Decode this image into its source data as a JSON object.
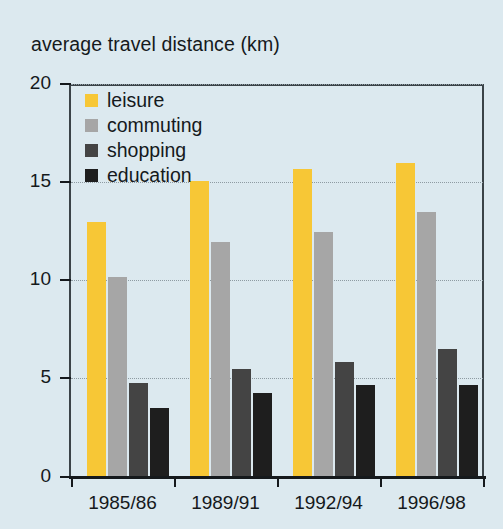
{
  "chart_data": {
    "type": "bar",
    "title": "average travel distance (km)",
    "xlabel": "",
    "ylabel": "average travel distance (km)",
    "ylim": [
      0,
      20
    ],
    "yticks": [
      0,
      5,
      10,
      15,
      20
    ],
    "ytick_labels": [
      "0",
      "5",
      "10",
      "15",
      "20"
    ],
    "grid": true,
    "legend_position": "top-left inside plot",
    "categories": [
      "1985/86",
      "1989/91",
      "1992/94",
      "1996/98"
    ],
    "series": [
      {
        "name": "leisure",
        "color": "#f7c736",
        "values": [
          13.0,
          15.1,
          15.7,
          16.0
        ]
      },
      {
        "name": "commuting",
        "color": "#a6a6a6",
        "values": [
          10.2,
          12.0,
          12.5,
          13.5
        ]
      },
      {
        "name": "shopping",
        "color": "#444444",
        "values": [
          4.8,
          5.5,
          5.85,
          6.5
        ]
      },
      {
        "name": "education",
        "color": "#1e1e1e",
        "values": [
          3.5,
          4.3,
          4.7,
          4.7
        ]
      }
    ]
  },
  "colors": {
    "background": "#dce9ef",
    "axis": "#15191c",
    "gridline": "#8e9ba2",
    "leisure": "#f7c736",
    "commuting": "#a6a6a6",
    "shopping": "#444444",
    "education": "#1e1e1e"
  }
}
